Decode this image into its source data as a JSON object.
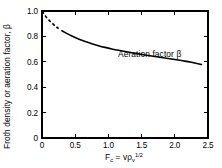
{
  "chart_data": {
    "type": "line",
    "title": "",
    "xlabel": "Fc = vρv^1/2",
    "ylabel": "Froth density or aeration factor, β",
    "xlim": [
      0,
      2.5
    ],
    "ylim": [
      0,
      1.0
    ],
    "grid": false,
    "legend_position": "inline-annotation",
    "x_ticks": [
      "0",
      "0.5",
      "1.0",
      "1.5",
      "2.0",
      "2.5"
    ],
    "x_tick_values": [
      0,
      0.5,
      1.0,
      1.5,
      2.0,
      2.5
    ],
    "y_ticks": [
      "0",
      "0.2",
      "0.4",
      "0.6",
      "0.8",
      "1.0"
    ],
    "y_tick_values": [
      0,
      0.2,
      0.4,
      0.6,
      0.8,
      1.0
    ],
    "annotations": [
      {
        "text": "Aeration factor β",
        "x": 1.35,
        "y": 0.7
      }
    ],
    "series": [
      {
        "name": "Aeration factor β",
        "style": "solid-with-dashed-lead",
        "dashed_range": [
          0.0,
          0.28
        ],
        "x": [
          0.0,
          0.05,
          0.1,
          0.15,
          0.2,
          0.25,
          0.3,
          0.4,
          0.5,
          0.6,
          0.7,
          0.8,
          0.9,
          1.0,
          1.1,
          1.2,
          1.3,
          1.4,
          1.5,
          1.6,
          1.7,
          1.8,
          1.9,
          2.0,
          2.1,
          2.2,
          2.3,
          2.4
        ],
        "values": [
          1.0,
          0.96,
          0.93,
          0.905,
          0.882,
          0.862,
          0.845,
          0.815,
          0.79,
          0.768,
          0.75,
          0.734,
          0.72,
          0.707,
          0.696,
          0.686,
          0.676,
          0.667,
          0.658,
          0.65,
          0.642,
          0.634,
          0.626,
          0.618,
          0.61,
          0.601,
          0.591,
          0.578
        ]
      }
    ]
  },
  "axis_label_parts": {
    "x_main": "F",
    "x_main_sub": "c",
    "x_equals": "=",
    "x_rho": "vρ",
    "x_rho_sub": "v",
    "x_rho_sup": "1/2"
  },
  "colors": {
    "curve": "#000000",
    "axis": "#000000",
    "background": "#ffffff"
  }
}
